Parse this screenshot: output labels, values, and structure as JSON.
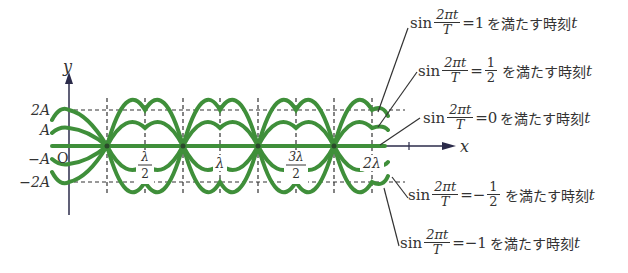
{
  "axes": {
    "x_label": "x",
    "y_label": "y",
    "origin_label": "O",
    "y_ticks": [
      "2A",
      "A",
      "−A",
      "−2A"
    ],
    "x_ticks": [
      {
        "label_num": "λ",
        "label_den": "2"
      },
      {
        "label": "λ"
      },
      {
        "label_num": "3λ",
        "label_den": "2"
      },
      {
        "label": "2λ"
      }
    ]
  },
  "colors": {
    "wave": "#3f8f3a",
    "axis": "#2b2b4a",
    "grid": "#333333",
    "leader": "#333333"
  },
  "waves": [
    {
      "amplitude": "2A",
      "condition": "1"
    },
    {
      "amplitude": "A",
      "condition": "1/2"
    },
    {
      "amplitude": "0",
      "condition": "0"
    },
    {
      "amplitude": "-A",
      "condition": "-1/2"
    },
    {
      "amplitude": "-2A",
      "condition": "-1"
    }
  ],
  "annotations": [
    {
      "sin": "sin",
      "num": "2πt",
      "den": "T",
      "eq": "=",
      "rhs": "1",
      "text": "を満たす時刻",
      "var": "t"
    },
    {
      "sin": "sin",
      "num": "2πt",
      "den": "T",
      "eq": "=",
      "rhs_num": "1",
      "rhs_den": "2",
      "text": "を満たす時刻",
      "var": "t"
    },
    {
      "sin": "sin",
      "num": "2πt",
      "den": "T",
      "eq": "=",
      "rhs": "0",
      "text": "を満たす時刻",
      "var": "t"
    },
    {
      "sin": "sin",
      "num": "2πt",
      "den": "T",
      "eq": "=−",
      "rhs_num": "1",
      "rhs_den": "2",
      "text": "を満たす時刻",
      "var": "t"
    },
    {
      "sin": "sin",
      "num": "2πt",
      "den": "T",
      "eq": "=",
      "rhs": "−1",
      "text": "を満たす時刻",
      "var": "t"
    }
  ]
}
